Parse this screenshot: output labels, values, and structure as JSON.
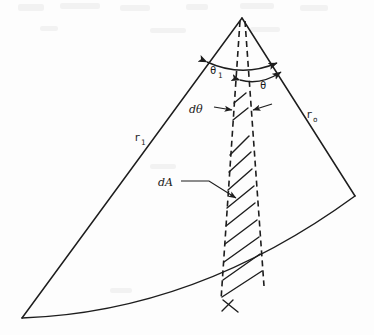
{
  "figure": {
    "type": "technical-line-diagram",
    "background_color": "#fdfdfd",
    "ink_color": "#1d1d1d"
  },
  "labels": {
    "r_inner": {
      "base": "r",
      "sub": "1",
      "full": "r₁",
      "x": 134,
      "y": 141
    },
    "r_outer": {
      "base": "r",
      "sub": "o",
      "full": "rₒ",
      "x": 306,
      "y": 121
    },
    "theta_1": {
      "base": "θ",
      "sub": "1",
      "full": "θ₁",
      "x": 210,
      "y": 74
    },
    "theta": {
      "base": "θ",
      "sub": "",
      "full": "θ",
      "x": 263,
      "y": 87
    },
    "d_theta": {
      "full": "dθ",
      "x": 193,
      "y": 112
    },
    "d_area": {
      "full": "dA",
      "x": 163,
      "y": 185
    }
  },
  "geometry": {
    "apex": {
      "x": 242,
      "y": 18
    },
    "left_corner": {
      "x": 22,
      "y": 318
    },
    "right_corner": {
      "x": 355,
      "y": 196
    },
    "arc_sag": 28,
    "strip_left_top": {
      "x": 238,
      "y": 22
    },
    "strip_right_top": {
      "x": 246,
      "y": 22
    },
    "strip_left_bottom": {
      "x": 221,
      "y": 288
    },
    "strip_right_bottom": {
      "x": 262,
      "y": 272
    },
    "hatch_count": 9
  },
  "annotations": {
    "dtheta_arrow_left_tip": {
      "x": 231,
      "y": 110
    },
    "dtheta_arrow_right_tip": {
      "x": 253,
      "y": 110
    },
    "dA_leader_start": {
      "x": 183,
      "y": 181
    },
    "dA_leader_end": {
      "x": 234,
      "y": 198
    }
  }
}
